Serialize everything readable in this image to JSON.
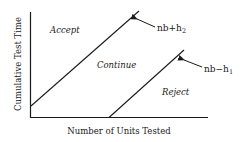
{
  "diagram": {
    "x_axis_label": "Number of Units Tested",
    "y_axis_label": "Cumulative Test Time",
    "regions": {
      "accept": "Accept",
      "continue": "Continue",
      "reject": "Reject"
    },
    "lines": [
      {
        "name": "upper",
        "label_base": "nb+h",
        "label_sub": "2"
      },
      {
        "name": "lower",
        "label_base": "nb−h",
        "label_sub": "1"
      }
    ],
    "colors": {
      "ink": "#1a1a1a",
      "background": "#ffffff"
    }
  }
}
